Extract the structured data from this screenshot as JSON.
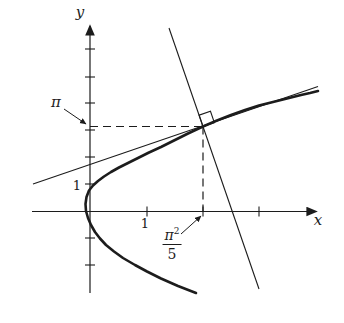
{
  "labels": {
    "y_axis": "y",
    "x_axis": "x",
    "pi": "π",
    "y_tick_one": "1",
    "x_tick_one": "1",
    "frac_numerator_base": "π",
    "frac_numerator_exp": "2",
    "frac_denominator": "5"
  },
  "colors": {
    "ink": "#1c1c1c",
    "background": "#ffffff"
  },
  "chart_data": {
    "type": "line",
    "xlabel": "x",
    "ylabel": "y",
    "x_tick_values": [
      1,
      2,
      3
    ],
    "y_tick_values": [
      -2,
      -1,
      1,
      2,
      3,
      4,
      5,
      6
    ],
    "labeled_ticks": {
      "x": [
        1
      ],
      "y": [
        1
      ]
    },
    "axis_annotations": {
      "y_axis_value": "π",
      "x_axis_value": "π²/5"
    },
    "x_range": [
      -1.0,
      4.1
    ],
    "y_range": [
      -3.1,
      7.3
    ],
    "grid": false,
    "legend": "none",
    "series": [
      {
        "name": "curve",
        "equation": "y² = 5x",
        "sample_points_xy": [
          [
            1.8,
            -3
          ],
          [
            0.8,
            -2
          ],
          [
            0.2,
            -1
          ],
          [
            0,
            0
          ],
          [
            0.2,
            1
          ],
          [
            0.8,
            2
          ],
          [
            1.8,
            3
          ],
          [
            1.974,
            3.142
          ],
          [
            3.2,
            4
          ],
          [
            3.96,
            4.45
          ]
        ]
      },
      {
        "name": "tangent-line",
        "description": "tangent to y²=5x at (π²/5, π), slope 5/(2π) ≈ 0.796",
        "point": [
          1.974,
          3.142
        ]
      },
      {
        "name": "normal-line",
        "description": "normal to the curve at (π²/5, π), drawn perpendicular to the tangent",
        "point": [
          1.974,
          3.142
        ]
      }
    ],
    "dashed_guides": [
      {
        "from": [
          0,
          3.142
        ],
        "to": [
          1.974,
          3.142
        ]
      },
      {
        "from": [
          1.974,
          3.142
        ],
        "to": [
          1.974,
          0
        ]
      }
    ],
    "right_angle_marker_at": [
      1.974,
      3.142
    ]
  },
  "layout_px": {
    "origin": [
      90,
      211.5
    ],
    "unit": [
      57.5,
      27
    ],
    "x_axis": {
      "y": 211.5,
      "x0": 32,
      "x1": 316
    },
    "y_axis": {
      "x": 90,
      "y0": 293,
      "y1": 26
    },
    "x_ticks": [
      147,
      203,
      259
    ],
    "y_ticks": [
      49,
      77,
      103,
      130,
      157,
      184,
      238,
      265
    ],
    "tick_half": 5,
    "point": [
      203,
      126.5
    ],
    "tangent": [
      [
        33,
        184
      ],
      [
        318,
        86.5
      ]
    ],
    "normal": [
      [
        169,
        28
      ],
      [
        259,
        289
      ]
    ],
    "dash_h": [
      [
        90,
        126.5
      ],
      [
        203,
        126.5
      ]
    ],
    "dash_v": [
      [
        203,
        126.5
      ],
      [
        203,
        211.5
      ]
    ],
    "square_size": 12,
    "annotation_arrows": [
      {
        "from": [
          64,
          109
        ],
        "to": [
          86,
          124
        ]
      },
      {
        "from": [
          181,
          234
        ],
        "to": [
          201,
          216
        ]
      }
    ],
    "curve_points": [
      [
        196,
        293
      ],
      [
        178,
        286
      ],
      [
        161,
        278.5
      ],
      [
        147,
        271.5
      ],
      [
        135,
        265
      ],
      [
        123,
        258
      ],
      [
        114,
        251.5
      ],
      [
        106,
        245
      ],
      [
        100,
        238.5
      ],
      [
        95,
        232
      ],
      [
        91,
        225
      ],
      [
        88,
        218
      ],
      [
        86,
        211
      ],
      [
        85.5,
        204
      ],
      [
        86.5,
        197
      ],
      [
        89,
        190.5
      ],
      [
        93,
        185.5
      ],
      [
        98,
        181
      ],
      [
        104,
        176.5
      ],
      [
        111,
        172
      ],
      [
        119,
        167.5
      ],
      [
        128,
        163
      ],
      [
        138,
        158
      ],
      [
        149,
        152.5
      ],
      [
        161,
        147
      ],
      [
        174,
        140.5
      ],
      [
        188,
        133.5
      ],
      [
        203,
        126.5
      ],
      [
        217,
        120.5
      ],
      [
        231,
        115
      ],
      [
        245,
        110
      ],
      [
        259,
        105.5
      ],
      [
        273,
        102
      ],
      [
        287,
        98.5
      ],
      [
        301,
        95
      ],
      [
        310,
        93
      ],
      [
        318,
        91
      ]
    ]
  }
}
